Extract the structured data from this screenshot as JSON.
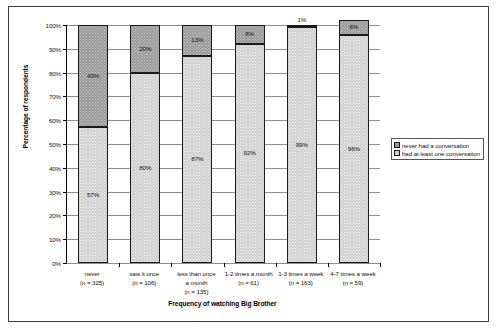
{
  "chart_data": {
    "type": "bar",
    "subtype": "stacked-100-percent",
    "title": "",
    "xlabel": "Frequency of watching Big Brother",
    "ylabel": "Percentage of respondents",
    "ylim": [
      0,
      100
    ],
    "ytick_labels": [
      "100%",
      "90%",
      "80%",
      "70%",
      "60%",
      "50%",
      "40%",
      "30%",
      "20%",
      "10%",
      "0%"
    ],
    "ytick_values": [
      100,
      90,
      80,
      70,
      60,
      50,
      40,
      30,
      20,
      10,
      0
    ],
    "grid": true,
    "legend_position": "right",
    "categories": [
      "never",
      "saw it once",
      "less than once a month",
      "1-2 times a month",
      "1-3 times a week",
      "4-7 times a week"
    ],
    "category_lines": [
      [
        "never",
        "(n = 325)"
      ],
      [
        "saw it once",
        "(n = 106)"
      ],
      [
        "less than once",
        "a month",
        "(n = 135)"
      ],
      [
        "1-2 times a month",
        "(n = 61)"
      ],
      [
        "1-3 times a week",
        "(n = 163)"
      ],
      [
        "4-7 times a week",
        "(n = 59)"
      ]
    ],
    "sample_sizes": [
      325,
      106,
      135,
      61,
      163,
      59
    ],
    "series": [
      {
        "name": "had at least one conversation",
        "values": [
          57,
          80,
          87,
          92,
          99,
          96
        ],
        "labels": [
          "57%",
          "80%",
          "87%",
          "92%",
          "99%",
          "96%"
        ]
      },
      {
        "name": "never had a conversation",
        "values": [
          43,
          20,
          13,
          8,
          1,
          6
        ],
        "labels": [
          "43%",
          "20%",
          "13%",
          "8%",
          "1%",
          "6%"
        ]
      }
    ],
    "colors": {
      "never_had_conversation": "#9a9a9a",
      "had_at_least_one_conversation": "#cfcfcf",
      "gridline": "#8e8e8e",
      "axis": "#000000",
      "frame": "#3a3a3a"
    }
  },
  "legend": {
    "items": [
      {
        "label": "never had a conversation",
        "swatch": "dark"
      },
      {
        "label": "had at least one conversation",
        "swatch": "light"
      }
    ]
  }
}
